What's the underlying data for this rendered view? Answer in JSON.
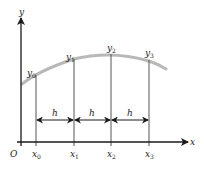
{
  "diagram": {
    "axes": {
      "x_label": "x",
      "y_label": "y",
      "origin_label": "O"
    },
    "ordinates": [
      {
        "x_label": "x",
        "x_sub": "0",
        "y_label": "y",
        "y_sub": "0"
      },
      {
        "x_label": "x",
        "x_sub": "1",
        "y_label": "y",
        "y_sub": "1"
      },
      {
        "x_label": "x",
        "x_sub": "2",
        "y_label": "y",
        "y_sub": "2"
      },
      {
        "x_label": "x",
        "x_sub": "3",
        "y_label": "y",
        "y_sub": "3"
      }
    ],
    "spacing_label": "h",
    "colors": {
      "axis": "#1a1a1a",
      "curve": "#b5b5b5",
      "gridline": "#555555"
    }
  }
}
